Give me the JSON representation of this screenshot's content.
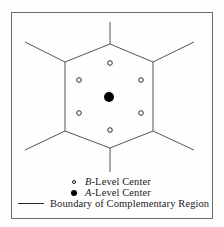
{
  "figure": {
    "frame": {
      "stroke": "#6b6b6b",
      "background": "#fefefe"
    }
  },
  "diagram": {
    "boundary_color": "#555555",
    "a_level_color": "#000000",
    "b_level_color": "#1a1a1a",
    "hexagon_vertices": [
      {
        "x": 110,
        "y": 44
      },
      {
        "x": 153,
        "y": 62
      },
      {
        "x": 153,
        "y": 131
      },
      {
        "x": 110,
        "y": 148
      },
      {
        "x": 65,
        "y": 131
      },
      {
        "x": 65,
        "y": 62
      }
    ],
    "radiating_lines": [
      {
        "name": "top-spur",
        "x1": 110,
        "y1": 44,
        "x2": 110,
        "y2": 22
      },
      {
        "name": "upper-right-spur",
        "x1": 153,
        "y1": 62,
        "x2": 194,
        "y2": 42
      },
      {
        "name": "lower-right-spur",
        "x1": 153,
        "y1": 131,
        "x2": 194,
        "y2": 150
      },
      {
        "name": "bottom-spur",
        "x1": 110,
        "y1": 148,
        "x2": 110,
        "y2": 172
      },
      {
        "name": "lower-left-spur",
        "x1": 65,
        "y1": 131,
        "x2": 25,
        "y2": 150
      },
      {
        "name": "upper-left-spur",
        "x1": 65,
        "y1": 62,
        "x2": 25,
        "y2": 42
      }
    ],
    "a_level_centers": [
      {
        "name": "center",
        "x": 109,
        "y": 97,
        "r": 5
      }
    ],
    "b_level_centers": [
      {
        "name": "north",
        "x": 110,
        "y": 63
      },
      {
        "name": "northwest",
        "x": 79,
        "y": 80
      },
      {
        "name": "northeast",
        "x": 141,
        "y": 80
      },
      {
        "name": "southwest",
        "x": 79,
        "y": 113
      },
      {
        "name": "southeast",
        "x": 141,
        "y": 113
      },
      {
        "name": "south",
        "x": 110,
        "y": 130
      }
    ]
  },
  "legend": {
    "items": [
      {
        "marker": "open-circle",
        "symbol": "B",
        "label": "-Level Center",
        "full_text": "B-Level Center"
      },
      {
        "marker": "filled-circle",
        "symbol": "A",
        "label": "-Level Center",
        "full_text": "A-Level Center"
      },
      {
        "marker": "line",
        "symbol": "",
        "label": "Boundary of Complementary Region",
        "full_text": "Boundary of Complementary Region"
      }
    ]
  }
}
